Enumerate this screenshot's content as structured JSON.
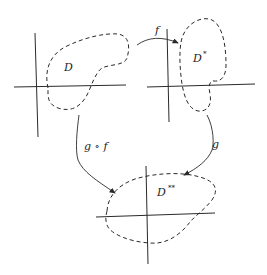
{
  "diagram": {
    "regions": [
      {
        "id": "domain",
        "label": "D",
        "superscript": ""
      },
      {
        "id": "image-f",
        "label": "D",
        "superscript": "*"
      },
      {
        "id": "image-gf",
        "label": "D",
        "superscript": "**"
      }
    ],
    "arrows": [
      {
        "id": "map-f",
        "label": "f",
        "from": "D",
        "to": "D*"
      },
      {
        "id": "map-g",
        "label": "g",
        "from": "D*",
        "to": "D**"
      },
      {
        "id": "map-gof",
        "label": "g ∘ f",
        "from": "D",
        "to": "D**"
      }
    ],
    "colors": {
      "ink": "#2a2a2a",
      "background": "#ffffff"
    }
  }
}
